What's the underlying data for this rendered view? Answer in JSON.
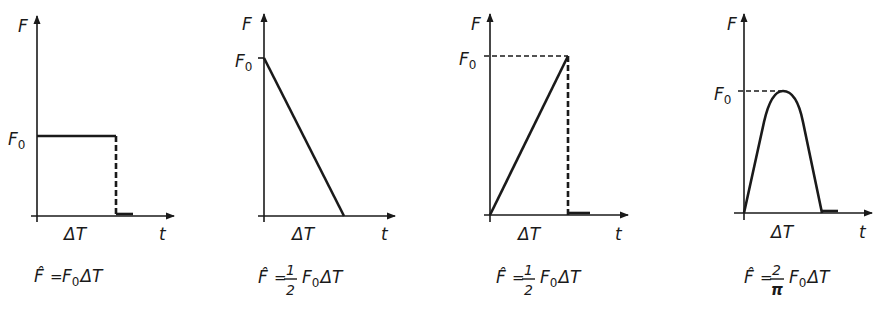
{
  "panels": [
    {
      "id": "rectangular",
      "y_label": "F",
      "x_label": "t",
      "level_label": "F",
      "level_sub": "0",
      "duration_label": "ΔT",
      "formula": {
        "lhs": "F̂",
        "eq": "=",
        "frac_num": "",
        "frac_den": "",
        "rhs_F": "F",
        "rhs_sub": "0",
        "rhs_dt": "ΔT"
      }
    },
    {
      "id": "triangular-decreasing",
      "y_label": "F",
      "x_label": "t",
      "level_label": "F",
      "level_sub": "0",
      "duration_label": "ΔT",
      "formula": {
        "lhs": "F̂",
        "eq": "=",
        "frac_num": "1",
        "frac_den": "2",
        "rhs_F": "F",
        "rhs_sub": "0",
        "rhs_dt": "ΔT"
      }
    },
    {
      "id": "triangular-increasing",
      "y_label": "F",
      "x_label": "t",
      "level_label": "F",
      "level_sub": "0",
      "duration_label": "ΔT",
      "formula": {
        "lhs": "F̂",
        "eq": "=",
        "frac_num": "1",
        "frac_den": "2",
        "rhs_F": "F",
        "rhs_sub": "0",
        "rhs_dt": "ΔT"
      }
    },
    {
      "id": "half-sine",
      "y_label": "F",
      "x_label": "t",
      "level_label": "F",
      "level_sub": "0",
      "duration_label": "ΔT",
      "formula": {
        "lhs": "F̂",
        "eq": "=",
        "frac_num": "2",
        "frac_den": "π",
        "rhs_F": "F",
        "rhs_sub": "0",
        "rhs_dt": "ΔT"
      }
    }
  ]
}
